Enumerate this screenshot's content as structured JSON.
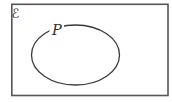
{
  "diagram": {
    "type": "set-venn-diagram",
    "universal_set_label": "ℰ",
    "set_label": "P",
    "colors": {
      "border": "#565656",
      "line": "#3a3a3a",
      "background": "#ffffff"
    }
  }
}
